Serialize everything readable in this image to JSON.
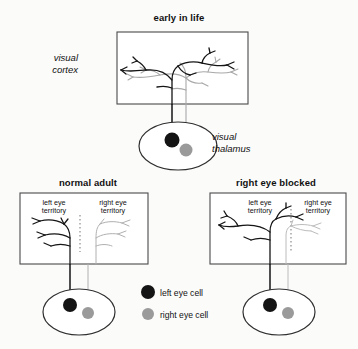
{
  "figure": {
    "title_top": "early in life",
    "title_bottom_left": "normal adult",
    "title_bottom_right": "right eye blocked"
  },
  "structures": {
    "cortex_label": "visual\ncortex",
    "cortex_label_line1": "visual",
    "cortex_label_line2": "cortex",
    "thalamus_label_line1": "visual",
    "thalamus_label_line2": "thalamus"
  },
  "panels": {
    "early_in_life": {
      "title": "early in life",
      "description": "Black and gray thalamic axon arbors overlap broadly across the visual cortex"
    },
    "normal_adult": {
      "title": "normal adult",
      "left_territory_line1": "left eye",
      "left_territory_line2": "territory",
      "right_territory_line1": "right eye",
      "right_territory_line2": "territory",
      "description": "Arbors segregate into separate equal eye-specific territories divided by a dotted border"
    },
    "right_eye_blocked": {
      "title": "right eye blocked",
      "left_territory_line1": "left eye",
      "left_territory_line2": "territory",
      "right_territory_line1": "right eye",
      "right_territory_line2": "territory",
      "description": "Black left-eye arbor expands across the border while the gray right-eye arbor shrinks"
    }
  },
  "legend": {
    "items": [
      {
        "marker": "black-dot",
        "label": "left eye cell",
        "color": "#141414"
      },
      {
        "marker": "gray-dot",
        "label": "right eye cell",
        "color": "#9a9a9a"
      }
    ],
    "left_label": "left eye cell",
    "right_label": "right eye cell"
  },
  "colors": {
    "left_eye": "#141414",
    "right_eye": "#9a9a9a",
    "outline": "#3a3a3a",
    "background": "#fbfbfa"
  }
}
